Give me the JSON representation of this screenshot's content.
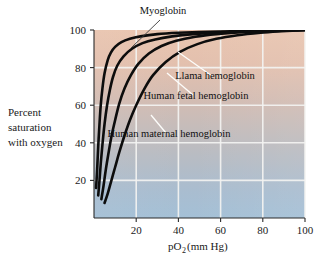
{
  "chart_data": {
    "type": "line",
    "title": "",
    "xlabel": "pO2 (mm Hg)",
    "xlabel_main": "pO",
    "xlabel_sub": "2",
    "xlabel_unit": " (mm Hg)",
    "ylabel": "Percent saturation with oxygen",
    "ylabel_lines": [
      "Percent",
      "saturation",
      "with oxygen"
    ],
    "xlim": [
      0,
      100
    ],
    "ylim": [
      0,
      100
    ],
    "xticks": [
      20,
      40,
      60,
      80,
      100
    ],
    "yticks": [
      20,
      40,
      60,
      80,
      100
    ],
    "xtick_labels": [
      "20",
      "40",
      "60",
      "80",
      "100"
    ],
    "ytick_labels": [
      "20",
      "40",
      "60",
      "80",
      "100"
    ],
    "grid": true,
    "grid_color": "#f4f4f2",
    "legend_position": "inline-annotations",
    "background_gradient_top": "#e8c3ae",
    "background_gradient_mid": "#c9bdb8",
    "background_gradient_bottom": "#a8c0d4",
    "curve_color": "#0d0d0d",
    "series": [
      {
        "name": "Myoglobin",
        "label": "Myoglobin",
        "x": [
          1.0,
          1.5,
          2.0,
          2.6,
          3.2,
          4.0,
          5.0,
          6.5,
          8.0,
          10.0,
          13.0,
          17.0,
          22.0,
          30.0,
          40.0,
          55.0,
          70.0,
          85.0,
          100.0
        ],
        "y": [
          16,
          26,
          38,
          50,
          60,
          69,
          77,
          84,
          88,
          91,
          93.5,
          95.3,
          96.6,
          97.8,
          98.5,
          99.1,
          99.4,
          99.7,
          100.0
        ]
      },
      {
        "name": "Llama hemoglobin",
        "label": "Llama hemoglobin",
        "x": [
          2.0,
          2.6,
          3.2,
          4.0,
          5.0,
          6.2,
          7.5,
          9.0,
          11.0,
          14.0,
          18.0,
          23.0,
          29.0,
          37.0,
          47.0,
          60.0,
          75.0,
          88.0,
          100.0
        ],
        "y": [
          12,
          20,
          29,
          39,
          50,
          60,
          68,
          75,
          81,
          86,
          90,
          93,
          95,
          96.6,
          97.8,
          98.7,
          99.3,
          99.7,
          100.0
        ]
      },
      {
        "name": "Human fetal hemoglobin",
        "label": "Human fetal hemoglobin",
        "x": [
          3.5,
          4.5,
          5.5,
          6.8,
          8.2,
          10.0,
          12.0,
          14.5,
          17.5,
          21.0,
          26.0,
          32.0,
          39.0,
          48.0,
          58.0,
          70.0,
          82.0,
          92.0,
          100.0
        ],
        "y": [
          10,
          17,
          25,
          34,
          43,
          52,
          61,
          69,
          76,
          82,
          87.5,
          91.5,
          94.3,
          96.4,
          97.8,
          98.8,
          99.4,
          99.8,
          100.0
        ]
      },
      {
        "name": "Human maternal hemoglobin",
        "label": "Human maternal hemoglobin",
        "x": [
          5.0,
          6.5,
          8.0,
          10.0,
          12.0,
          14.5,
          17.0,
          20.0,
          24.0,
          28.0,
          34.0,
          41.0,
          49.0,
          58.0,
          68.0,
          79.0,
          89.0,
          95.0,
          100.0
        ],
        "y": [
          8,
          13,
          19,
          27,
          35,
          44,
          52,
          60,
          69,
          76,
          83,
          88.5,
          92.5,
          95.3,
          97.2,
          98.5,
          99.3,
          99.7,
          100.0
        ]
      }
    ],
    "annotations": [
      {
        "text": "Myoglobin",
        "x_px": 163,
        "y_px": 14
      },
      {
        "text": "Llama hemoglobin",
        "x_px": 215,
        "y_px": 79
      },
      {
        "text": "Human fetal hemoglobin",
        "x_px": 196,
        "y_px": 99
      },
      {
        "text": "Human maternal hemoglobin",
        "x_px": 169,
        "y_px": 137
      }
    ]
  }
}
